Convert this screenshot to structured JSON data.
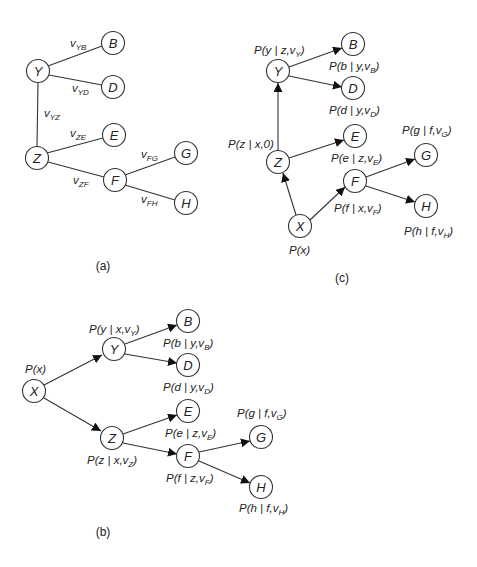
{
  "figure": {
    "panels": [
      {
        "id": "a",
        "caption": "(a)",
        "type": "undirected-tree",
        "nodes": [
          "Y",
          "B",
          "D",
          "Z",
          "E",
          "F",
          "G",
          "H"
        ],
        "edges": [
          {
            "from": "Y",
            "to": "B",
            "label": "v",
            "sub": "YB"
          },
          {
            "from": "Y",
            "to": "D",
            "label": "v",
            "sub": "YD"
          },
          {
            "from": "Y",
            "to": "Z",
            "label": "v",
            "sub": "YZ"
          },
          {
            "from": "Z",
            "to": "E",
            "label": "v",
            "sub": "ZE"
          },
          {
            "from": "Z",
            "to": "F",
            "label": "v",
            "sub": "ZF"
          },
          {
            "from": "F",
            "to": "G",
            "label": "v",
            "sub": "FG"
          },
          {
            "from": "F",
            "to": "H",
            "label": "v",
            "sub": "FH"
          }
        ]
      },
      {
        "id": "b",
        "caption": "(b)",
        "type": "directed-tree",
        "root": "X",
        "nodes": [
          "X",
          "Y",
          "B",
          "D",
          "Z",
          "E",
          "F",
          "G",
          "H"
        ],
        "edges": [
          {
            "from": "X",
            "to": "Y"
          },
          {
            "from": "X",
            "to": "Z"
          },
          {
            "from": "Y",
            "to": "B"
          },
          {
            "from": "Y",
            "to": "D"
          },
          {
            "from": "Z",
            "to": "E"
          },
          {
            "from": "Z",
            "to": "F"
          },
          {
            "from": "F",
            "to": "G"
          },
          {
            "from": "F",
            "to": "H"
          }
        ],
        "probabilities": {
          "X": {
            "main": "P(x)"
          },
          "Y": {
            "main": "P(y | x,v",
            "sub": "Y",
            "end": ")"
          },
          "B": {
            "main": "P(b | y,v",
            "sub": "B",
            "end": ")"
          },
          "D": {
            "main": "P(d | y,v",
            "sub": "D",
            "end": ")"
          },
          "Z": {
            "main": "P(z | x,v",
            "sub": "Z",
            "end": ")"
          },
          "E": {
            "main": "P(e | z,v",
            "sub": "E",
            "end": ")"
          },
          "F": {
            "main": "P(f | z,v",
            "sub": "F",
            "end": ")"
          },
          "G": {
            "main": "P(g | f,v",
            "sub": "G",
            "end": ")"
          },
          "H": {
            "main": "P(h | f,v",
            "sub": "H",
            "end": ")"
          }
        }
      },
      {
        "id": "c",
        "caption": "(c)",
        "type": "directed-tree",
        "root": "X",
        "nodes": [
          "X",
          "Z",
          "Y",
          "B",
          "D",
          "E",
          "F",
          "G",
          "H"
        ],
        "edges": [
          {
            "from": "X",
            "to": "Z"
          },
          {
            "from": "X",
            "to": "F"
          },
          {
            "from": "Z",
            "to": "Y"
          },
          {
            "from": "Z",
            "to": "E"
          },
          {
            "from": "Y",
            "to": "B"
          },
          {
            "from": "Y",
            "to": "D"
          },
          {
            "from": "F",
            "to": "G"
          },
          {
            "from": "F",
            "to": "H"
          }
        ],
        "probabilities": {
          "X": {
            "main": "P(x)"
          },
          "Z": {
            "main": "P(z | x,0)"
          },
          "Y": {
            "main": "P(y | z,v",
            "sub": "Y",
            "end": ")"
          },
          "B": {
            "main": "P(b | y,v",
            "sub": "B",
            "end": ")"
          },
          "D": {
            "main": "P(d | y,v",
            "sub": "D",
            "end": ")"
          },
          "E": {
            "main": "P(e | z,v",
            "sub": "E",
            "end": ")"
          },
          "F": {
            "main": "P(f | x,v",
            "sub": "F",
            "end": ")"
          },
          "G": {
            "main": "P(g | f,v",
            "sub": "G",
            "end": ")"
          },
          "H": {
            "main": "P(h | f,v",
            "sub": "H",
            "end": ")"
          }
        }
      }
    ]
  },
  "labels": {
    "a": {
      "Y": "Y",
      "B": "B",
      "D": "D",
      "Z": "Z",
      "E": "E",
      "F": "F",
      "G": "G",
      "H": "H",
      "v": "v",
      "YB": "YB",
      "YD": "YD",
      "YZ": "YZ",
      "ZE": "ZE",
      "ZF": "ZF",
      "FG": "FG",
      "FH": "FH",
      "caption": "(a)"
    },
    "b": {
      "X": "X",
      "Y": "Y",
      "B": "B",
      "D": "D",
      "Z": "Z",
      "E": "E",
      "F": "F",
      "G": "G",
      "H": "H",
      "caption": "(b)",
      "px": "P(x)",
      "py": "P(y | x,v",
      "py_s": "Y",
      "pb": "P(b | y,v",
      "pb_s": "B",
      "pd": "P(d | y,v",
      "pd_s": "D",
      "pz": "P(z | x,v",
      "pz_s": "Z",
      "pe": "P(e | z,v",
      "pe_s": "E",
      "pf": "P(f | z,v",
      "pf_s": "F",
      "pg": "P(g | f,v",
      "pg_s": "G",
      "ph": "P(h | f,v",
      "ph_s": "H",
      "close": ")"
    },
    "c": {
      "X": "X",
      "Y": "Y",
      "B": "B",
      "D": "D",
      "Z": "Z",
      "E": "E",
      "F": "F",
      "G": "G",
      "H": "H",
      "caption": "(c)",
      "px": "P(x)",
      "pz": "P(z | x,0)",
      "py": "P(y | z,v",
      "py_s": "Y",
      "pb": "P(b | y,v",
      "pb_s": "B",
      "pd": "P(d | y,v",
      "pd_s": "D",
      "pe": "P(e | z,v",
      "pe_s": "E",
      "pf": "P(f | x,v",
      "pf_s": "F",
      "pg": "P(g | f,v",
      "pg_s": "G",
      "ph": "P(h | f,v",
      "ph_s": "H",
      "close": ")"
    }
  }
}
